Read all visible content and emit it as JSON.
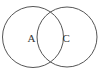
{
  "diagram": {
    "type": "venn",
    "stroke_color": "#555555",
    "label_color": "#333333",
    "sets": [
      {
        "label": "A",
        "cx": 33,
        "cy": 37,
        "r": 30.5
      },
      {
        "label": "C",
        "cx": 67,
        "cy": 37,
        "r": 30
      }
    ]
  }
}
